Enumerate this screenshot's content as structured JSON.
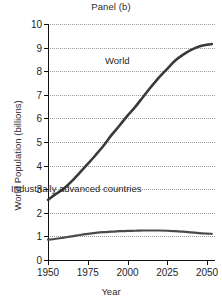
{
  "chart_data": {
    "type": "line",
    "title": "Panel (b)",
    "xlabel": "Year",
    "ylabel": "World Population (billions)",
    "xlim": [
      1950,
      2055
    ],
    "ylim": [
      0,
      10
    ],
    "grid": "horizontal-dotted",
    "legend": "inline-annotations",
    "x_ticks": [
      1950,
      1975,
      2000,
      2025,
      2050
    ],
    "x_tick_labels": [
      "1950",
      "1975",
      "2000",
      "2025",
      "2050"
    ],
    "y_ticks": [
      0,
      1,
      2,
      3,
      4,
      5,
      6,
      7,
      8,
      9,
      10
    ],
    "y_tick_labels": [
      "0",
      "1",
      "2",
      "3",
      "4",
      "5",
      "6",
      "7",
      "8",
      "9",
      "10"
    ],
    "series": [
      {
        "name": "World",
        "color": "#3a3a3a",
        "annotation": "World",
        "x": [
          1950,
          1955,
          1960,
          1965,
          1970,
          1975,
          1980,
          1985,
          1990,
          1995,
          2000,
          2005,
          2010,
          2015,
          2020,
          2025,
          2030,
          2035,
          2040,
          2045,
          2050,
          2053
        ],
        "values": [
          2.55,
          2.8,
          3.03,
          3.34,
          3.7,
          4.07,
          4.45,
          4.85,
          5.3,
          5.7,
          6.12,
          6.5,
          6.93,
          7.35,
          7.75,
          8.1,
          8.45,
          8.7,
          8.9,
          9.05,
          9.12,
          9.15
        ]
      },
      {
        "name": "Industrially advanced countries",
        "color": "#4a4a4a",
        "annotation": "Industrially advanced countries",
        "x": [
          1950,
          1955,
          1960,
          1965,
          1970,
          1975,
          1980,
          1985,
          1990,
          1995,
          2000,
          2005,
          2010,
          2015,
          2020,
          2025,
          2030,
          2035,
          2040,
          2045,
          2050,
          2053
        ],
        "values": [
          0.86,
          0.9,
          0.95,
          1.0,
          1.06,
          1.11,
          1.15,
          1.18,
          1.2,
          1.22,
          1.23,
          1.24,
          1.25,
          1.25,
          1.25,
          1.24,
          1.22,
          1.2,
          1.17,
          1.14,
          1.12,
          1.11
        ]
      }
    ]
  }
}
